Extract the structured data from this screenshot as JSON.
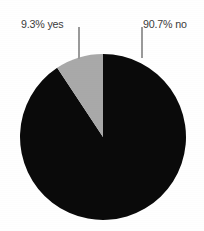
{
  "chart_data": {
    "type": "pie",
    "title": "",
    "categories": [
      "no",
      "yes"
    ],
    "values": [
      90.7,
      9.3
    ],
    "labels": [
      "90.7% no",
      "9.3% yes"
    ],
    "units": "percent",
    "total": 100,
    "legend": "none",
    "slices": [
      {
        "name": "no",
        "label": "90.7% no",
        "value": 90.7,
        "color": "#0a0a0a",
        "start_angle_deg": 0,
        "sweep_deg": 326.5
      },
      {
        "name": "yes",
        "label": "9.3% yes",
        "value": 9.3,
        "color": "#a9a9a9",
        "start_angle_deg": 326.5,
        "sweep_deg": 33.5
      }
    ],
    "start_angle_note": "first slice begins at 12 o'clock, drawn clockwise",
    "geometry": {
      "center_x": 103,
      "center_y": 137,
      "radius": 83
    }
  },
  "annotations": {
    "yes": {
      "text": "9.3% yes",
      "leader_name": "leader-line-yes"
    },
    "no": {
      "text": "90.7% no",
      "leader_name": "leader-line-no"
    }
  },
  "colors": {
    "background": "#ffffff",
    "slice_no": "#0a0a0a",
    "slice_yes": "#a9a9a9",
    "label_text": "#3b3b3b",
    "leader_line": "#9a9a9a"
  }
}
